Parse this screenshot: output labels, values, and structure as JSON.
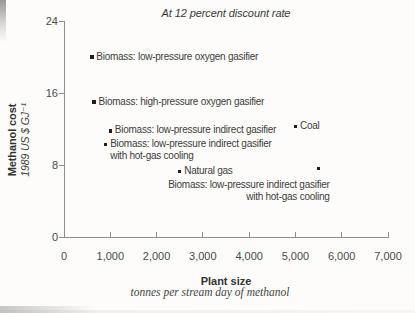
{
  "chart_data": {
    "type": "scatter",
    "title": "At 12 percent discount rate",
    "grid": false,
    "legend": "none",
    "x_axis": {
      "label": "Plant size",
      "sublabel": "tonnes per stream day of methanol",
      "range": [
        0,
        7000
      ],
      "ticks": [
        {
          "value": 0,
          "label": "0"
        },
        {
          "value": 1000,
          "label": "1,000"
        },
        {
          "value": 2000,
          "label": "2,000"
        },
        {
          "value": 3000,
          "label": "3,000"
        },
        {
          "value": 4000,
          "label": "4,000"
        },
        {
          "value": 5000,
          "label": "5,000"
        },
        {
          "value": 6000,
          "label": "6,000"
        },
        {
          "value": 7000,
          "label": "7,000"
        }
      ]
    },
    "y_axis": {
      "label": "Methanol cost",
      "sublabel": "1989 US $ GJ⁻¹",
      "range": [
        0,
        24
      ],
      "ticks": [
        {
          "value": 24,
          "label": "24"
        },
        {
          "value": 16,
          "label": "16"
        },
        {
          "value": 8,
          "label": "8"
        },
        {
          "value": 0,
          "label": "0"
        }
      ]
    },
    "points": [
      {
        "x": 600,
        "y": 20.0,
        "label_lines": [
          "Biomass: low-pressure oxygen gasifier"
        ],
        "placement": "right"
      },
      {
        "x": 650,
        "y": 15.0,
        "label_lines": [
          "Biomass: high-pressure oxygen gasifier"
        ],
        "placement": "right"
      },
      {
        "x": 1000,
        "y": 11.8,
        "label_lines": [
          "Biomass: low-pressure indirect gasifier"
        ],
        "placement": "right"
      },
      {
        "x": 900,
        "y": 10.3,
        "label_lines": [
          "Biomass: low-pressure indirect gasifier",
          "with hot-gas cooling"
        ],
        "placement": "right"
      },
      {
        "x": 2500,
        "y": 7.3,
        "label_lines": [
          "Natural gas"
        ],
        "placement": "right"
      },
      {
        "x": 5000,
        "y": 12.3,
        "label_lines": [
          "Coal"
        ],
        "placement": "right"
      },
      {
        "x": 5500,
        "y": 7.6,
        "label_lines": [
          "Biomass: low-pressure indirect gasifier",
          "with hot-gas cooling"
        ],
        "placement": "below-right-aligned"
      }
    ],
    "colors": {
      "background": "#fdfcfa",
      "axis": "#8f8f8f",
      "marker": "#1f1f1f",
      "text": "#3d3d3d"
    }
  }
}
